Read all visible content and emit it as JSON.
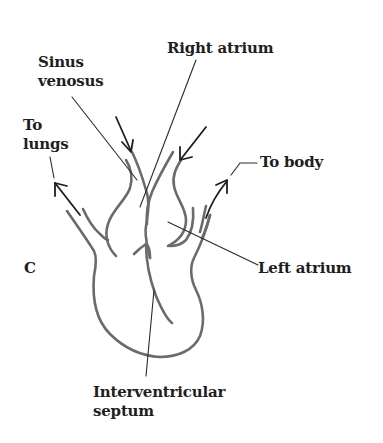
{
  "figure": {
    "panel_letter": "C",
    "labels": {
      "right_atrium": "Right atrium",
      "sinus_venosus_line1": "Sinus",
      "sinus_venosus_line2": "venosus",
      "to_lungs_line1": "To",
      "to_lungs_line2": "lungs",
      "to_body": "To body",
      "left_atrium": "Left atrium",
      "interventricular_line1": "Interventricular",
      "interventricular_line2": "septum"
    },
    "colors": {
      "outline": "#6b6b6b",
      "text": "#1e1e1e",
      "leader": "#2a2a2a",
      "background": "#ffffff"
    }
  }
}
